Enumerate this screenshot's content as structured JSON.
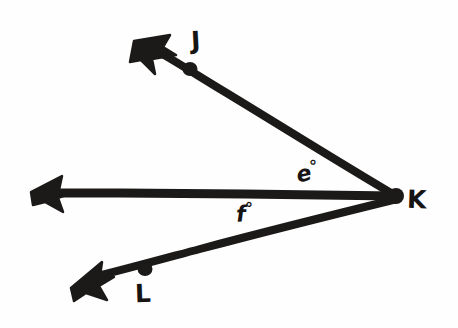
{
  "figure": {
    "kind": "hand-drawn-geometry-diagram",
    "background_color": "#fefefe",
    "ink_color": "#1c1a19",
    "stroke_width": 8,
    "width": 458,
    "height": 328
  },
  "points": [
    {
      "id": "J",
      "label": "J",
      "dot_x": 190,
      "dot_y": 69,
      "label_x": 191,
      "label_y": 28
    },
    {
      "id": "K",
      "label": "K",
      "dot_x": 396,
      "dot_y": 196,
      "label_x": 407,
      "label_y": 187
    },
    {
      "id": "L",
      "label": "L",
      "dot_x": 145,
      "dot_y": 269,
      "label_x": 135,
      "label_y": 281
    }
  ],
  "rays": [
    {
      "id": "ray-KJ",
      "name": "ray-k-j",
      "from": "K",
      "through": "J",
      "start_x": 396,
      "start_y": 196,
      "end_x": 143,
      "end_y": 46,
      "arrow_at": "end"
    },
    {
      "id": "ray-K-horizontal",
      "name": "ray-k-horizontal",
      "from": "K",
      "through": "",
      "start_x": 396,
      "start_y": 195,
      "end_x": 44,
      "end_y": 193,
      "arrow_at": "end"
    },
    {
      "id": "ray-KL",
      "name": "ray-k-l",
      "from": "K",
      "through": "L",
      "start_x": 396,
      "start_y": 200,
      "end_x": 83,
      "end_y": 280,
      "arrow_at": "end"
    }
  ],
  "angle_labels": [
    {
      "id": "e",
      "variable": "e",
      "degree_symbol": "°",
      "full_text": "e°",
      "x": 296,
      "y": 160,
      "between": [
        "ray-KJ",
        "ray-K-horizontal"
      ]
    },
    {
      "id": "f",
      "variable": "f",
      "degree_symbol": "°",
      "full_text": "f°",
      "x": 236,
      "y": 201,
      "between": [
        "ray-K-horizontal",
        "ray-KL"
      ]
    }
  ]
}
